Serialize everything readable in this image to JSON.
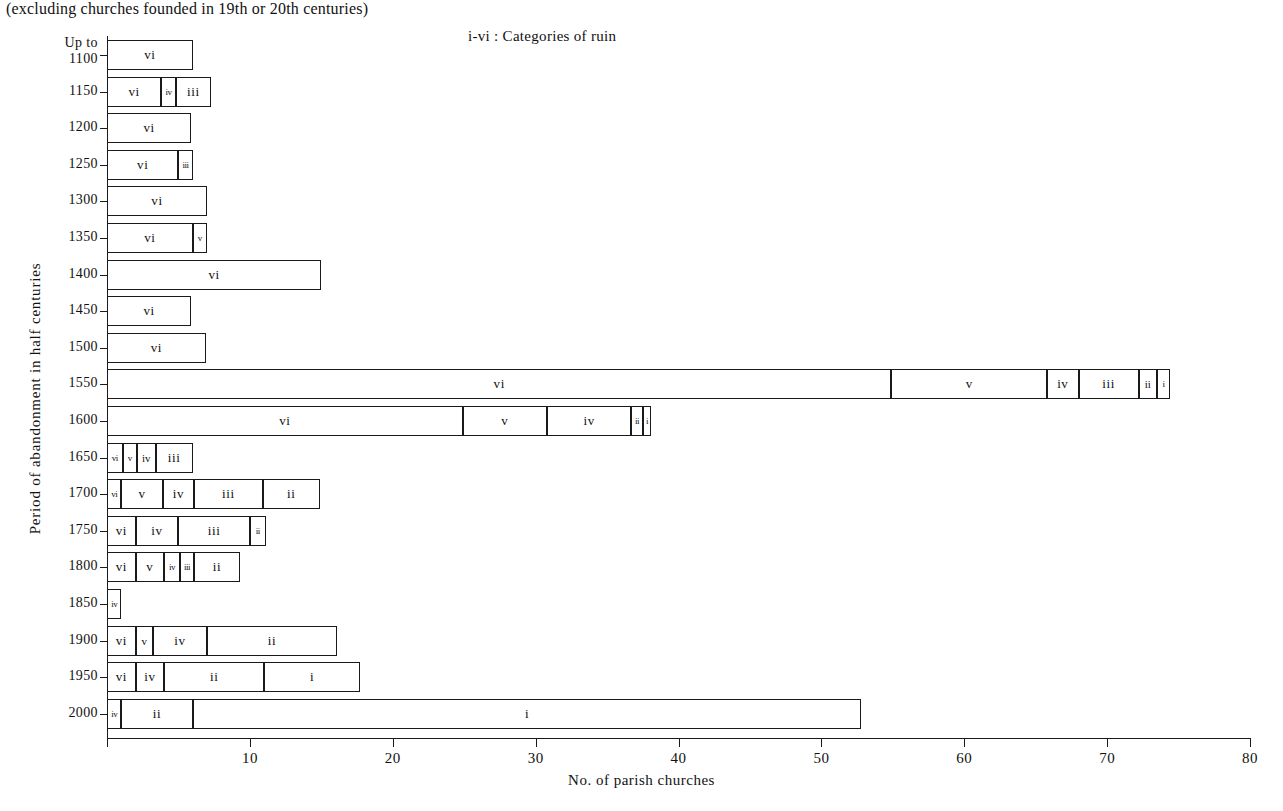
{
  "subtitle": "(excluding churches founded in 19th or 20th centuries)",
  "legend_note": "i-vi : Categories of ruin",
  "axis": {
    "y_title": "Period of abandonment in half centuries",
    "x_title": "No. of parish churches",
    "x_ticks": [
      "0",
      "10",
      "20",
      "30",
      "40",
      "50",
      "60",
      "70",
      "80"
    ],
    "x_min": 0,
    "x_max": 80,
    "y_categories": [
      "Up to 1100",
      "1150",
      "1200",
      "1250",
      "1300",
      "1350",
      "1400",
      "1450",
      "1500",
      "1550",
      "1600",
      "1650",
      "1700",
      "1750",
      "1800",
      "1850",
      "1900",
      "1950",
      "2000"
    ]
  },
  "colors": {
    "ink": "#1a1a1a",
    "fill": "#ffffff",
    "background": "#ffffff"
  },
  "chart_data": {
    "type": "bar",
    "orientation": "horizontal",
    "stacked": true,
    "title": "",
    "subtitle": "(excluding churches founded in 19th or 20th centuries)",
    "xlabel": "No. of parish churches",
    "ylabel": "Period of abandonment in half centuries",
    "xlim": [
      0,
      80
    ],
    "grid": false,
    "legend": "i-vi : Categories of ruin",
    "legend_position": "top-right",
    "categories": [
      "Up to 1100",
      "1150",
      "1200",
      "1250",
      "1300",
      "1350",
      "1400",
      "1450",
      "1500",
      "1550",
      "1600",
      "1650",
      "1700",
      "1750",
      "1800",
      "1850",
      "1900",
      "1950",
      "2000"
    ],
    "series_order": [
      "vi",
      "v",
      "iv",
      "iii",
      "ii",
      "i"
    ],
    "rows": [
      {
        "category": "Up to 1100",
        "total": 6,
        "segments": [
          {
            "label": "vi",
            "value": 6
          }
        ]
      },
      {
        "category": "1150",
        "total": 7.3,
        "segments": [
          {
            "label": "vi",
            "value": 3.8
          },
          {
            "label": "iv",
            "value": 1.0
          },
          {
            "label": "iii",
            "value": 2.5
          }
        ]
      },
      {
        "category": "1200",
        "total": 5.9,
        "segments": [
          {
            "label": "vi",
            "value": 5.9
          }
        ]
      },
      {
        "category": "1250",
        "total": 6.0,
        "segments": [
          {
            "label": "vi",
            "value": 5.0
          },
          {
            "label": "iii",
            "value": 1.0
          }
        ]
      },
      {
        "category": "1300",
        "total": 7.0,
        "segments": [
          {
            "label": "vi",
            "value": 7.0
          }
        ]
      },
      {
        "category": "1350",
        "total": 7.0,
        "segments": [
          {
            "label": "vi",
            "value": 6.0
          },
          {
            "label": "v",
            "value": 1.0
          }
        ]
      },
      {
        "category": "1400",
        "total": 15.0,
        "segments": [
          {
            "label": "vi",
            "value": 15.0
          }
        ]
      },
      {
        "category": "1450",
        "total": 5.9,
        "segments": [
          {
            "label": "vi",
            "value": 5.9
          }
        ]
      },
      {
        "category": "1500",
        "total": 6.9,
        "segments": [
          {
            "label": "vi",
            "value": 6.9
          }
        ]
      },
      {
        "category": "1550",
        "total": 74.4,
        "segments": [
          {
            "label": "vi",
            "value": 54.9
          },
          {
            "label": "v",
            "value": 10.9
          },
          {
            "label": "iv",
            "value": 2.2
          },
          {
            "label": "iii",
            "value": 4.2
          },
          {
            "label": "ii",
            "value": 1.3
          },
          {
            "label": "i",
            "value": 0.9
          }
        ]
      },
      {
        "category": "1600",
        "total": 38.1,
        "segments": [
          {
            "label": "vi",
            "value": 24.9
          },
          {
            "label": "v",
            "value": 5.9
          },
          {
            "label": "iv",
            "value": 5.9
          },
          {
            "label": "ii",
            "value": 0.8
          },
          {
            "label": "i",
            "value": 0.6
          }
        ]
      },
      {
        "category": "1650",
        "total": 6.0,
        "segments": [
          {
            "label": "vi",
            "value": 1.1
          },
          {
            "label": "v",
            "value": 1.0
          },
          {
            "label": "iv",
            "value": 1.3
          },
          {
            "label": "iii",
            "value": 2.6
          }
        ]
      },
      {
        "category": "1700",
        "total": 14.9,
        "segments": [
          {
            "label": "vi",
            "value": 1.0
          },
          {
            "label": "v",
            "value": 2.9
          },
          {
            "label": "iv",
            "value": 2.2
          },
          {
            "label": "iii",
            "value": 4.8
          },
          {
            "label": "ii",
            "value": 4.0
          }
        ]
      },
      {
        "category": "1750",
        "total": 11.1,
        "segments": [
          {
            "label": "vi",
            "value": 2.0
          },
          {
            "label": "iv",
            "value": 3.0
          },
          {
            "label": "iii",
            "value": 5.0
          },
          {
            "label": "ii",
            "value": 1.1
          }
        ]
      },
      {
        "category": "1800",
        "total": 9.3,
        "segments": [
          {
            "label": "vi",
            "value": 2.0
          },
          {
            "label": "v",
            "value": 2.0
          },
          {
            "label": "iv",
            "value": 1.1
          },
          {
            "label": "iii",
            "value": 1.0
          },
          {
            "label": "ii",
            "value": 3.2
          }
        ]
      },
      {
        "category": "1850",
        "total": 1.0,
        "segments": [
          {
            "label": "iv",
            "value": 1.0
          }
        ]
      },
      {
        "category": "1900",
        "total": 16.1,
        "segments": [
          {
            "label": "vi",
            "value": 2.0
          },
          {
            "label": "v",
            "value": 1.2
          },
          {
            "label": "iv",
            "value": 3.8
          },
          {
            "label": "ii",
            "value": 9.1
          }
        ]
      },
      {
        "category": "1950",
        "total": 17.7,
        "segments": [
          {
            "label": "vi",
            "value": 2.0
          },
          {
            "label": "iv",
            "value": 2.0
          },
          {
            "label": "ii",
            "value": 7.0
          },
          {
            "label": "i",
            "value": 6.7
          }
        ]
      },
      {
        "category": "2000",
        "total": 52.8,
        "segments": [
          {
            "label": "iv",
            "value": 1.0
          },
          {
            "label": "ii",
            "value": 5.0
          },
          {
            "label": "i",
            "value": 46.8
          }
        ]
      }
    ]
  }
}
